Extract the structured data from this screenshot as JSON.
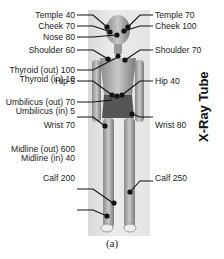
{
  "figure": {
    "caption": "(a)",
    "side_label": "X-Ray Tube",
    "left_labels": [
      {
        "text": "Temple 40"
      },
      {
        "text": "Cheek 70"
      },
      {
        "text": "Nose 80"
      },
      {
        "text": "Shoulder 60"
      },
      {
        "text": "Thyroid (out) 100"
      },
      {
        "text": "Thyroid (in) 10"
      },
      {
        "text": "Hip 5"
      },
      {
        "text": "Umbilicus (out) 70"
      },
      {
        "text": "Umbilicus (in) 5"
      },
      {
        "text": "Wrist 70"
      },
      {
        "text": "Midline (out) 600"
      },
      {
        "text": "Midline (in) 40"
      },
      {
        "text": "Calf 200"
      }
    ],
    "right_labels": [
      {
        "text": "Temple 70"
      },
      {
        "text": "Cheek 100"
      },
      {
        "text": "Shoulder 70"
      },
      {
        "text": "Hip 40"
      },
      {
        "text": "Wrist 80"
      },
      {
        "text": "Calf 250"
      }
    ]
  }
}
